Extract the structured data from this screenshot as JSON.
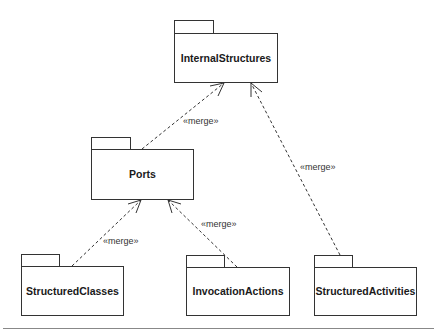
{
  "diagram": {
    "type": "UML package diagram",
    "packages": [
      {
        "id": "internal",
        "name": "InternalStructures"
      },
      {
        "id": "ports",
        "name": "Ports"
      },
      {
        "id": "structured_classes",
        "name": "StructuredClasses"
      },
      {
        "id": "invocation_actions",
        "name": "InvocationActions"
      },
      {
        "id": "structured_activities",
        "name": "StructuredActivities"
      }
    ],
    "dependencies": [
      {
        "from": "Ports",
        "to": "InternalStructures",
        "label": "«merge»"
      },
      {
        "from": "StructuredClasses",
        "to": "Ports",
        "label": "«merge»"
      },
      {
        "from": "InvocationActions",
        "to": "Ports",
        "label": "«merge»"
      },
      {
        "from": "StructuredActivities",
        "to": "InternalStructures",
        "label": "«merge»"
      }
    ]
  }
}
